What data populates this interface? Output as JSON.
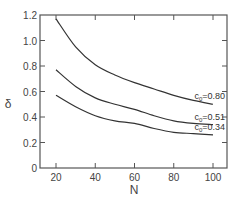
{
  "chart_data": {
    "type": "line",
    "title": "",
    "xlabel": "N",
    "ylabel": "δ",
    "xlim": [
      12,
      108
    ],
    "ylim": [
      0,
      1.2
    ],
    "grid": false,
    "legend": "inline labels at right end of curves",
    "x_ticks": [
      20,
      40,
      60,
      80,
      100
    ],
    "x_tick_labels": [
      "20",
      "40",
      "60",
      "80",
      "100"
    ],
    "y_ticks": [
      0,
      0.2,
      0.4,
      0.6,
      0.8,
      1.0,
      1.2
    ],
    "y_tick_labels": [
      "0",
      "0.2",
      "0.4",
      "0.6",
      "0.8",
      "1.0",
      "1.2"
    ],
    "x": [
      20,
      30,
      40,
      50,
      60,
      70,
      80,
      90,
      100
    ],
    "series": [
      {
        "name": "c0=0.80",
        "label_prefix": "c",
        "label_sub": "0",
        "label_suffix": "=0.80",
        "values": [
          1.17,
          0.95,
          0.81,
          0.73,
          0.67,
          0.62,
          0.57,
          0.53,
          0.5
        ]
      },
      {
        "name": "c0=0.51",
        "label_prefix": "c",
        "label_sub": "0",
        "label_suffix": "=0.51",
        "values": [
          0.77,
          0.64,
          0.55,
          0.5,
          0.46,
          0.41,
          0.37,
          0.35,
          0.34
        ]
      },
      {
        "name": "c0=0.34",
        "label_prefix": "c",
        "label_sub": "0",
        "label_suffix": "=0.34",
        "values": [
          0.57,
          0.48,
          0.41,
          0.37,
          0.35,
          0.31,
          0.28,
          0.27,
          0.26
        ]
      }
    ],
    "colors": {
      "line": "#333333",
      "axis": "#555555",
      "background": "#ffffff"
    }
  }
}
